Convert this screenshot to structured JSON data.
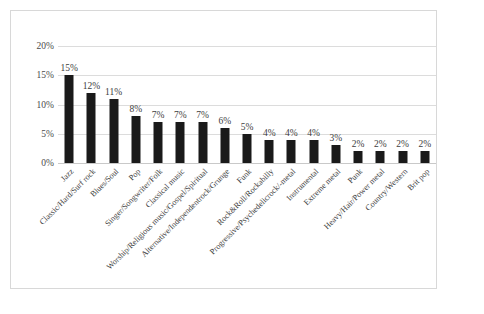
{
  "chart_data": {
    "type": "bar",
    "title": "",
    "subtitle": "",
    "xlabel": "",
    "ylabel": "",
    "ylim": [
      0,
      20
    ],
    "grid": true,
    "legend": "none",
    "orientation": "vertical",
    "bar_color": "#1a1a1a",
    "gridline_color": "#dcdcdc",
    "frame_color": "#d8d8d8",
    "y_ticks": [
      "0%",
      "5%",
      "10%",
      "15%",
      "20%"
    ],
    "y_tick_values": [
      0,
      5,
      10,
      15,
      20
    ],
    "categories": [
      "Jazz",
      "Classic/Hard/Surf rock",
      "Blues/Soul",
      "Pop",
      "Singer/Songwriter/Folk",
      "Classical music",
      "Worship/Religious music/Gospel/Spiritual",
      "Alternative/Independentrock/Grunge",
      "Funk",
      "Rock&Roll/Rockabilly",
      "Progressive/Psychedelicrock/-metal",
      "Instrumental",
      "Extreme metal",
      "Punk",
      "Heavy/Hair/Power metal",
      "Country/Western",
      "Brit pop"
    ],
    "values": [
      15,
      12,
      11,
      8,
      7,
      7,
      7,
      6,
      5,
      4,
      4,
      4,
      3,
      2,
      2,
      2,
      2
    ],
    "data_labels": [
      "15%",
      "12%",
      "11%",
      "8%",
      "7%",
      "7%",
      "7%",
      "6%",
      "5%",
      "4%",
      "4%",
      "4%",
      "3%",
      "2%",
      "2%",
      "2%",
      "2%"
    ]
  }
}
